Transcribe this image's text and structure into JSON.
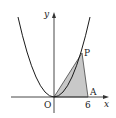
{
  "figure": {
    "labels": {
      "y_axis": "y",
      "x_axis": "x",
      "origin": "O",
      "point_p": "P",
      "point_a": "A",
      "tick_a": "6"
    },
    "colors": {
      "axis": "#333333",
      "curve": "#1a1a1a",
      "shade": "#c8c8c8",
      "triangle_edge": "#444444"
    }
  }
}
